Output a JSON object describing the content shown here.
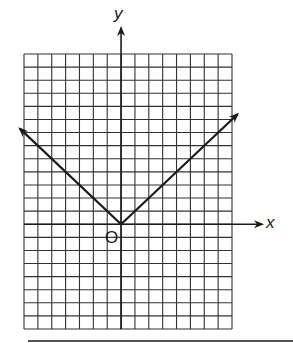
{
  "chart_data": {
    "type": "line",
    "title": "",
    "xlabel": "x",
    "ylabel": "y",
    "origin_label": "O",
    "grid": true,
    "grid_columns": 15,
    "grid_rows": 21,
    "xlim": [
      -7,
      8
    ],
    "ylim": [
      -8,
      13
    ],
    "series": [
      {
        "name": "y = |x|",
        "x": [
          -7.3,
          0,
          8.4
        ],
        "y": [
          7.3,
          0,
          8.4
        ],
        "arrows": [
          "start",
          "end"
        ]
      }
    ],
    "axes": {
      "x_arrow": true,
      "y_arrow": true
    }
  },
  "labels": {
    "x": "x",
    "y": "y",
    "origin": "O"
  },
  "colors": {
    "ink": "#1a1a1a",
    "grid": "#333333",
    "background": "#ffffff"
  }
}
